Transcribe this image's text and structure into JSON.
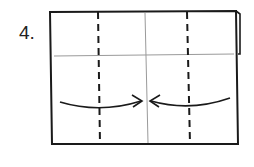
{
  "diagram": {
    "step_label": "4.",
    "type": "origami-fold-instruction",
    "elements": {
      "paper": "rectangle sheet",
      "creases": [
        "horizontal center crease",
        "vertical center crease"
      ],
      "fold_lines": [
        "left valley fold (dashed)",
        "right valley fold (dashed)"
      ],
      "arrows": [
        "left flap folds to center",
        "right flap folds to center"
      ]
    },
    "colors": {
      "outline": "#1a1a1a",
      "crease": "#9a9a9a",
      "background": "#ffffff"
    }
  }
}
